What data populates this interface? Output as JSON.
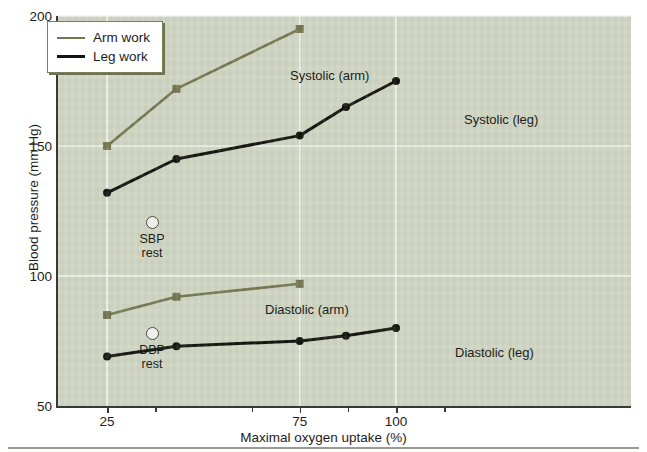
{
  "chart_data": {
    "type": "line",
    "title": "",
    "xlabel": "Maximal oxygen uptake (%)",
    "ylabel": "Blood pressure (mm Hg)",
    "xlim": [
      12,
      161
    ],
    "ylim": [
      50,
      200
    ],
    "xticks": [
      25,
      75,
      100
    ],
    "xtick_labels": [
      "25",
      "75",
      "100"
    ],
    "xminor_ticks": [
      37.5,
      62.5,
      87.5,
      112.5
    ],
    "yticks": [
      50,
      100,
      150,
      200
    ],
    "ytick_labels": [
      "50",
      "100",
      "150",
      "200"
    ],
    "grid": true,
    "legend_position": "top-left",
    "series": [
      {
        "name": "Systolic (arm)",
        "group": "Arm work",
        "color": "#73764f",
        "marker": "square",
        "x": [
          25,
          43,
          75
        ],
        "y": [
          150,
          172,
          195
        ]
      },
      {
        "name": "Systolic (leg)",
        "group": "Leg work",
        "color": "#14140f",
        "marker": "circle",
        "x": [
          25,
          43,
          75,
          87,
          100
        ],
        "y": [
          132,
          145,
          154,
          165,
          175
        ]
      },
      {
        "name": "Diastolic (arm)",
        "group": "Arm work",
        "color": "#73764f",
        "marker": "square",
        "x": [
          25,
          43,
          75
        ],
        "y": [
          85,
          92,
          97
        ]
      },
      {
        "name": "Diastolic (leg)",
        "group": "Leg work",
        "color": "#14140f",
        "marker": "circle",
        "x": [
          25,
          43,
          75,
          87,
          100
        ],
        "y": [
          69,
          73,
          75,
          77,
          80
        ]
      }
    ],
    "annotations": [
      {
        "label": "Systolic (arm)",
        "x": 290,
        "y": 68
      },
      {
        "label": "Systolic (leg)",
        "x": 464,
        "y": 112
      },
      {
        "label": "Diastolic (arm)",
        "x": 265,
        "y": 302
      },
      {
        "label": "Diastolic (leg)",
        "x": 455,
        "y": 345
      }
    ],
    "rest_markers": [
      {
        "id": "sbp-rest",
        "line1": "SBP",
        "line2": "rest",
        "x": 124,
        "y": 216
      },
      {
        "id": "dbp-rest",
        "line1": "DBP",
        "line2": "rest",
        "x": 124,
        "y": 327
      }
    ]
  },
  "legend": {
    "items": [
      {
        "label": "Arm work",
        "color": "#73764f",
        "width": 2.6
      },
      {
        "label": "Leg work",
        "color": "#14140f",
        "width": 3.0
      }
    ]
  },
  "colors": {
    "plot_background": "#ced4c2",
    "gridline": "#f2f4ee",
    "axis": "#3a3a34",
    "arm": "#73764f",
    "leg": "#14140f",
    "page_background": "#ffffff"
  }
}
